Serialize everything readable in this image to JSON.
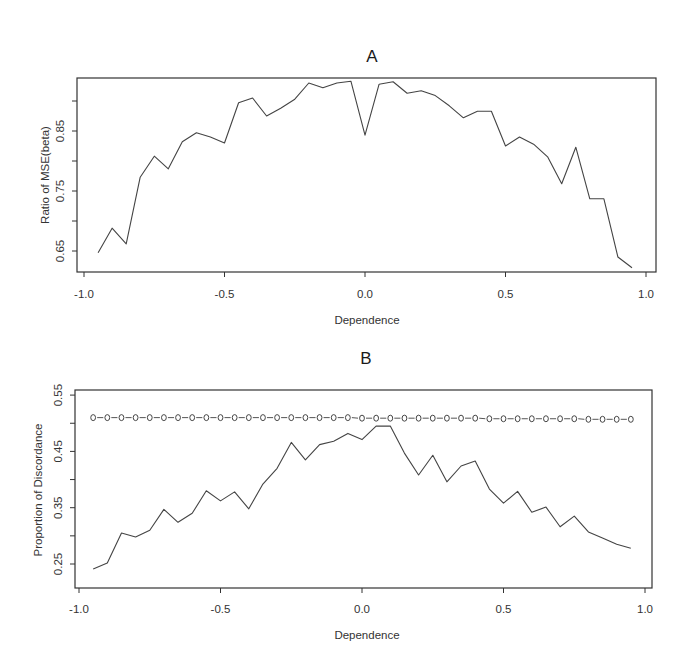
{
  "chart_data": [
    {
      "type": "line",
      "title": "A",
      "xlabel": "Dependence",
      "ylabel": "Ratio of MSE(beta)",
      "xlim": [
        -1.0,
        1.0
      ],
      "ylim": [
        0.62,
        0.95
      ],
      "xticks": [
        "-1.0",
        "-0.5",
        "0.0",
        "0.5",
        "1.0"
      ],
      "yticks": [
        "0.65",
        "0.75",
        "0.85"
      ],
      "ytick_values": [
        0.65,
        0.7,
        0.75,
        0.8,
        0.85,
        0.9
      ],
      "grid": false,
      "legend": null,
      "x": [
        -0.95,
        -0.9,
        -0.85,
        -0.8,
        -0.75,
        -0.7,
        -0.65,
        -0.6,
        -0.55,
        -0.5,
        -0.45,
        -0.4,
        -0.35,
        -0.3,
        -0.25,
        -0.2,
        -0.15,
        -0.1,
        -0.05,
        0.0,
        0.05,
        0.1,
        0.15,
        0.2,
        0.25,
        0.3,
        0.35,
        0.4,
        0.45,
        0.5,
        0.55,
        0.6,
        0.65,
        0.7,
        0.75,
        0.8,
        0.85,
        0.9,
        0.95
      ],
      "series": [
        {
          "name": "Ratio of MSE(beta)",
          "style": "line",
          "values": [
            0.647,
            0.688,
            0.662,
            0.773,
            0.808,
            0.787,
            0.832,
            0.847,
            0.84,
            0.83,
            0.897,
            0.905,
            0.875,
            0.888,
            0.903,
            0.93,
            0.922,
            0.93,
            0.933,
            0.843,
            0.928,
            0.932,
            0.913,
            0.917,
            0.909,
            0.892,
            0.872,
            0.883,
            0.883,
            0.825,
            0.84,
            0.828,
            0.807,
            0.762,
            0.823,
            0.737,
            0.737,
            0.64,
            0.622
          ]
        }
      ]
    },
    {
      "type": "line",
      "title": "B",
      "xlabel": "Dependence",
      "ylabel": "Proportion of Discordance",
      "xlim": [
        -1.0,
        1.0
      ],
      "ylim": [
        0.23,
        0.55
      ],
      "xticks": [
        "-1.0",
        "-0.5",
        "0.0",
        "0.5",
        "1.0"
      ],
      "yticks": [
        "0.25",
        "0.35",
        "0.45",
        "0.55"
      ],
      "ytick_values": [
        0.25,
        0.3,
        0.35,
        0.4,
        0.45,
        0.5,
        0.55
      ],
      "grid": false,
      "legend": null,
      "x": [
        -0.95,
        -0.9,
        -0.85,
        -0.8,
        -0.75,
        -0.7,
        -0.65,
        -0.6,
        -0.55,
        -0.5,
        -0.45,
        -0.4,
        -0.35,
        -0.3,
        -0.25,
        -0.2,
        -0.15,
        -0.1,
        -0.05,
        0.0,
        0.05,
        0.1,
        0.15,
        0.2,
        0.25,
        0.3,
        0.35,
        0.4,
        0.45,
        0.5,
        0.55,
        0.6,
        0.65,
        0.7,
        0.75,
        0.8,
        0.85,
        0.9,
        0.95
      ],
      "series": [
        {
          "name": "Observed discordance",
          "style": "line",
          "values": [
            0.241,
            0.252,
            0.305,
            0.298,
            0.31,
            0.347,
            0.324,
            0.34,
            0.38,
            0.362,
            0.378,
            0.348,
            0.392,
            0.42,
            0.466,
            0.435,
            0.462,
            0.468,
            0.482,
            0.471,
            0.495,
            0.495,
            0.447,
            0.408,
            0.443,
            0.396,
            0.424,
            0.433,
            0.383,
            0.358,
            0.379,
            0.342,
            0.351,
            0.316,
            0.335,
            0.307,
            0.296,
            0.285,
            0.278
          ]
        },
        {
          "name": "Reference (circles)",
          "style": "dashed-circles",
          "values": [
            0.51,
            0.51,
            0.51,
            0.51,
            0.51,
            0.51,
            0.51,
            0.51,
            0.51,
            0.51,
            0.51,
            0.51,
            0.51,
            0.51,
            0.51,
            0.51,
            0.51,
            0.51,
            0.51,
            0.509,
            0.509,
            0.509,
            0.509,
            0.509,
            0.509,
            0.509,
            0.509,
            0.509,
            0.508,
            0.508,
            0.508,
            0.508,
            0.508,
            0.508,
            0.508,
            0.507,
            0.507,
            0.507,
            0.507
          ]
        }
      ]
    }
  ],
  "figure": {
    "panels": [
      {
        "id": "A",
        "title": "A",
        "xlabel": "Dependence",
        "ylabel": "Ratio of MSE(beta)",
        "xtick_labels": [
          "-1.0",
          "-0.5",
          "0.0",
          "0.5",
          "1.0"
        ],
        "ytick_labels": [
          "0.65",
          "0.75",
          "0.85"
        ]
      },
      {
        "id": "B",
        "title": "B",
        "xlabel": "Dependence",
        "ylabel": "Proportion of Discordance",
        "xtick_labels": [
          "-1.0",
          "-0.5",
          "0.0",
          "0.5",
          "1.0"
        ],
        "ytick_labels": [
          "0.25",
          "0.35",
          "0.45",
          "0.55"
        ]
      }
    ],
    "colors": {
      "line": "#444444",
      "frame": "#333333",
      "background": "#ffffff"
    }
  }
}
